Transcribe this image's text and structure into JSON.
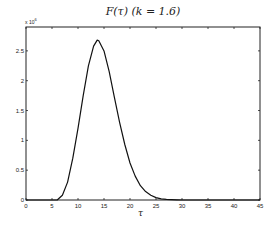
{
  "chart_data": {
    "type": "line",
    "title": "F(τ)  (k = 1.6)",
    "xlabel": "τ",
    "ylabel": "",
    "y_multiplier": "×10^6 (exponent illegible in screenshot)",
    "xlim": [
      0,
      45
    ],
    "ylim": [
      0,
      2.9
    ],
    "x_ticks": [
      0,
      5,
      10,
      15,
      20,
      25,
      30,
      35,
      40,
      45
    ],
    "y_ticks": [
      0,
      0.5,
      1,
      1.5,
      2,
      2.5
    ],
    "grid": false,
    "legend": null,
    "series": [
      {
        "name": "F(τ)",
        "x": [
          0,
          5,
          6,
          7,
          8,
          9,
          10,
          11,
          12,
          13,
          13.7,
          14,
          15,
          16,
          17,
          18,
          19,
          20,
          21,
          22,
          23,
          24,
          25,
          26,
          27,
          28,
          29,
          30,
          35,
          40,
          45
        ],
        "y": [
          0,
          0,
          0.0,
          0.08,
          0.3,
          0.7,
          1.2,
          1.75,
          2.25,
          2.58,
          2.68,
          2.67,
          2.5,
          2.15,
          1.72,
          1.3,
          0.93,
          0.62,
          0.4,
          0.24,
          0.14,
          0.08,
          0.04,
          0.02,
          0.01,
          0.005,
          0.002,
          0,
          0,
          0,
          0
        ]
      }
    ]
  },
  "labels": {
    "title": "F(τ)  (k = 1.6)",
    "multiplier_base": "x 10",
    "multiplier_exp": "6",
    "xlabel": "τ"
  }
}
